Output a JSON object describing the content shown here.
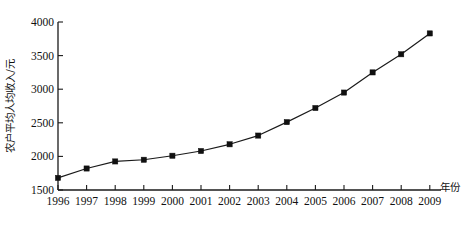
{
  "chart_data": {
    "type": "line",
    "title": "",
    "xlabel": "年份",
    "ylabel": "农户平均人均收入/元",
    "categories": [
      "1996",
      "1997",
      "1998",
      "1999",
      "2000",
      "2001",
      "2002",
      "2003",
      "2004",
      "2005",
      "2006",
      "2007",
      "2008",
      "2009"
    ],
    "x": [
      1996,
      1997,
      1998,
      1999,
      2000,
      2001,
      2002,
      2003,
      2004,
      2005,
      2006,
      2007,
      2008,
      2009
    ],
    "values": [
      1680,
      1820,
      1925,
      1950,
      2010,
      2080,
      2180,
      2310,
      2510,
      2720,
      2950,
      3250,
      3520,
      3830
    ],
    "series": [
      {
        "name": "农户平均人均收入",
        "values": [
          1680,
          1820,
          1925,
          1950,
          2010,
          2080,
          2180,
          2310,
          2510,
          2720,
          2950,
          3250,
          3520,
          3830
        ]
      }
    ],
    "ylim": [
      1500,
      4000
    ],
    "yticks": [
      1500,
      2000,
      2500,
      3000,
      3500,
      4000
    ],
    "ytick_labels": [
      "1500",
      "2000",
      "2500",
      "3000",
      "3500",
      "4000"
    ],
    "xlim": [
      1996,
      2009
    ],
    "grid": false,
    "legend": null,
    "marker": "square",
    "line_color": "#1a1a1a",
    "marker_color": "#101010"
  },
  "axes": {
    "y_axis_title": "农户平均人均收入/元",
    "x_axis_title": "年份"
  }
}
